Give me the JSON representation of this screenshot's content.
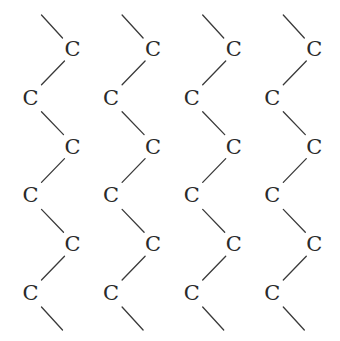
{
  "diagram": {
    "title": "",
    "atom_label": "C",
    "chain_count": 4,
    "atoms_per_chain": 6,
    "bond_color": "#3a3a3a",
    "atom_color": "#2a2a2a",
    "chains": [
      {
        "id": 1,
        "atoms": [
          "C",
          "C",
          "C",
          "C",
          "C",
          "C"
        ]
      },
      {
        "id": 2,
        "atoms": [
          "C",
          "C",
          "C",
          "C",
          "C",
          "C"
        ]
      },
      {
        "id": 3,
        "atoms": [
          "C",
          "C",
          "C",
          "C",
          "C",
          "C"
        ]
      },
      {
        "id": 4,
        "atoms": [
          "C",
          "C",
          "C",
          "C",
          "C",
          "C"
        ]
      }
    ]
  }
}
